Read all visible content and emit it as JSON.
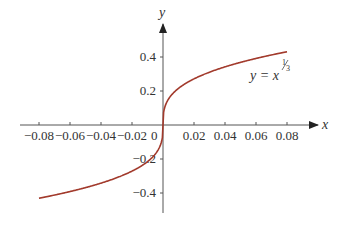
{
  "chart_data": {
    "type": "line",
    "title": "",
    "xlabel": "x",
    "ylabel": "y",
    "xlim": [
      -0.08,
      0.08
    ],
    "ylim": [
      -0.45,
      0.45
    ],
    "grid": false,
    "x_ticks": [
      "−0.08",
      "−0.06",
      "−0.04",
      "−0.02",
      "0.02",
      "0.04",
      "0.06",
      "0.08"
    ],
    "x_tick_values": [
      -0.08,
      -0.06,
      -0.04,
      -0.02,
      0.02,
      0.04,
      0.06,
      0.08
    ],
    "y_ticks": [
      "0.4",
      "0.2",
      "−0.2",
      "−0.4"
    ],
    "y_tick_values": [
      0.4,
      0.2,
      -0.2,
      -0.4
    ],
    "origin_label": "0",
    "series": [
      {
        "name": "y = x^(1/3)",
        "color": "#a23a2c",
        "x": [
          -0.08,
          -0.06,
          -0.04,
          -0.02,
          -0.01,
          -0.005,
          -0.001,
          0,
          0.001,
          0.005,
          0.01,
          0.02,
          0.04,
          0.06,
          0.08
        ],
        "values": [
          -0.431,
          -0.391,
          -0.342,
          -0.271,
          -0.215,
          -0.171,
          -0.1,
          0,
          0.1,
          0.171,
          0.215,
          0.271,
          0.342,
          0.391,
          0.431
        ]
      }
    ],
    "annotations": [
      {
        "text": "y = x",
        "exponent": "1/3",
        "position": "upper-right near curve"
      }
    ]
  },
  "labels": {
    "x_axis": "x",
    "y_axis": "y",
    "equation_base": "y = x",
    "equation_exp_num": "1",
    "equation_exp_den": "3"
  },
  "colors": {
    "axis": "#333333",
    "curve": "#a23a2c"
  }
}
